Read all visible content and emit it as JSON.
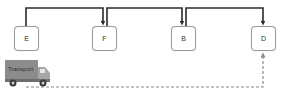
{
  "diagram": {
    "nodes": [
      {
        "id": "E",
        "label": "E"
      },
      {
        "id": "F",
        "label": "F"
      },
      {
        "id": "B",
        "label": "B"
      },
      {
        "id": "D",
        "label": "D"
      }
    ],
    "edges": [
      {
        "from": "E",
        "to": "F",
        "style": "solid"
      },
      {
        "from": "F",
        "to": "B",
        "style": "solid"
      },
      {
        "from": "B",
        "to": "D",
        "style": "solid"
      },
      {
        "from": "Transport",
        "to": "D",
        "style": "dashed"
      }
    ],
    "truck": {
      "label": "Transport",
      "icon": "truck-icon"
    },
    "colors": {
      "line": "#2b2b2b",
      "dashed": "#8a8a8a",
      "node_border": "#9a9a9a",
      "truck_body": "#8c8c8c",
      "truck_cab": "#a6a6a6"
    }
  }
}
